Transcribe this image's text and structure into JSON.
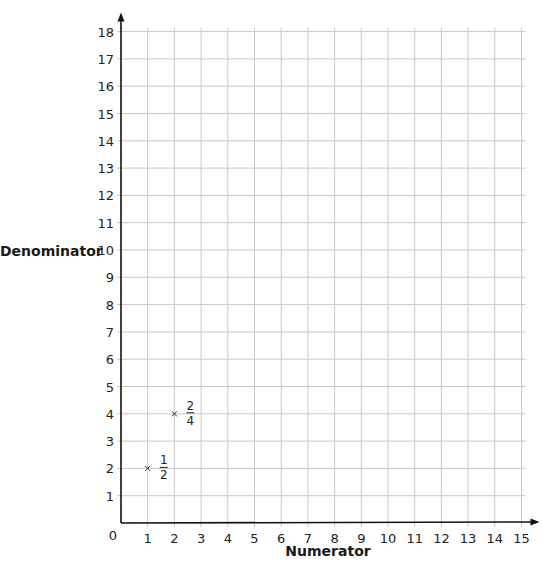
{
  "header": {
    "text": ""
  },
  "chart_data": {
    "type": "scatter",
    "title": "",
    "xlabel": "Numerator",
    "ylabel": "Denominator",
    "xlim": [
      0,
      15
    ],
    "ylim": [
      0,
      18
    ],
    "grid": true,
    "x_ticks": [
      0,
      1,
      2,
      3,
      4,
      5,
      6,
      7,
      8,
      9,
      10,
      11,
      12,
      13,
      14,
      15
    ],
    "y_ticks": [
      1,
      2,
      3,
      4,
      5,
      6,
      7,
      8,
      9,
      10,
      11,
      12,
      13,
      14,
      15,
      16,
      17,
      18
    ],
    "series": [
      {
        "name": "Equivalent fractions",
        "marker": "x",
        "points": [
          {
            "x": 1,
            "y": 2,
            "label_num": "1",
            "label_den": "2"
          },
          {
            "x": 2,
            "y": 4,
            "label_num": "2",
            "label_den": "4"
          }
        ]
      }
    ],
    "legend": null
  },
  "layout": {
    "origin_px": [
      121,
      523
    ],
    "x_step_px": 26.7,
    "y_step_px": 27.3,
    "grid_color": "#c8c8c8",
    "axis_color": "#111111"
  }
}
